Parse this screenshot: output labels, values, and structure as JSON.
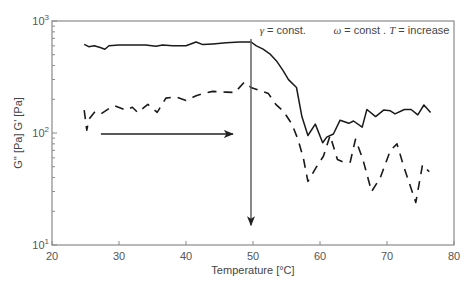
{
  "chart_data": {
    "type": "line",
    "title": "",
    "xlabel": "Temperature [°C]",
    "ylabel": "G'' [Pa] G' [Pa]",
    "xlim": [
      20,
      80
    ],
    "ylim": [
      10,
      1000
    ],
    "yscale": "log",
    "x_ticks": [
      20,
      30,
      40,
      50,
      60,
      70,
      80
    ],
    "y_ticks": [
      {
        "value": 10,
        "base": "10",
        "exp": "1"
      },
      {
        "value": 100,
        "base": "10",
        "exp": "2"
      },
      {
        "value": 1000,
        "base": "10",
        "exp": "3"
      }
    ],
    "grid": false,
    "legend": null,
    "annotations": [
      {
        "text_parts": [
          {
            "t": "γ",
            "italic": true
          },
          {
            "t": " = const."
          }
        ],
        "x": 51,
        "y": 830
      },
      {
        "text_parts": [
          {
            "t": "ω",
            "italic": true
          },
          {
            "t": " = const . "
          },
          {
            "t": "T",
            "italic": true
          },
          {
            "t": " = increase"
          }
        ],
        "x": 62,
        "y": 830
      }
    ],
    "arrows": [
      {
        "name": "temperature-increase-arrow",
        "from": [
          27.3,
          98
        ],
        "to": [
          47,
          98
        ]
      },
      {
        "name": "strain-drop-arrow",
        "from": [
          49.7,
          690
        ],
        "to": [
          49.7,
          15
        ]
      }
    ],
    "series": [
      {
        "name": "G' (solid)",
        "style": "solid",
        "x": [
          24.8,
          25.5,
          26.3,
          27.2,
          27.9,
          28.5,
          30,
          32,
          34,
          35.5,
          36.5,
          38,
          40,
          41.5,
          42.5,
          44,
          46,
          48,
          49.7,
          50.5,
          51.5,
          52.5,
          53.5,
          54.5,
          55.3,
          56.5,
          57.3,
          58.2,
          59.3,
          60.4,
          61,
          62,
          63,
          64.3,
          65,
          66.3,
          67,
          68.3,
          69.5,
          70.5,
          71.2,
          72.6,
          73.6,
          74.6,
          75.5,
          76.5
        ],
        "values": [
          620,
          590,
          600,
          580,
          560,
          600,
          610,
          612,
          610,
          595,
          610,
          600,
          600,
          650,
          615,
          625,
          640,
          650,
          650,
          600,
          560,
          510,
          440,
          360,
          300,
          255,
          140,
          95,
          120,
          82,
          92,
          98,
          130,
          122,
          128,
          113,
          162,
          140,
          160,
          158,
          148,
          162,
          162,
          145,
          178,
          152
        ]
      },
      {
        "name": "G'' (dashed)",
        "style": "dashed",
        "x": [
          24.8,
          25.2,
          25.5,
          26.4,
          27.3,
          28.5,
          29.4,
          31,
          32,
          32.8,
          34.3,
          35.7,
          37,
          38.5,
          40,
          41.5,
          42.5,
          44,
          46,
          47.3,
          48.7,
          49.7,
          51,
          52.3,
          53.4,
          54.6,
          55.8,
          56.7,
          57.5,
          58.2,
          59.5,
          60.5,
          61.5,
          62.6,
          63.5,
          64.5,
          65.3,
          66.4,
          67.7,
          69,
          70.5,
          71.5,
          72.5,
          74.3,
          75.3,
          76.3
        ],
        "values": [
          160,
          106,
          132,
          155,
          148,
          165,
          175,
          160,
          170,
          152,
          180,
          153,
          205,
          210,
          195,
          215,
          225,
          235,
          232,
          230,
          285,
          255,
          240,
          225,
          180,
          155,
          120,
          88,
          60,
          37,
          50,
          62,
          95,
          58,
          55,
          55,
          88,
          58,
          30,
          40,
          70,
          80,
          50,
          24,
          52,
          45
        ]
      }
    ]
  },
  "colors": {
    "background": "#ffffff",
    "axis": "#8a8a8a",
    "series": "#1a1a1a",
    "arrow": "#222222",
    "vertical_arrow": "#555555"
  }
}
